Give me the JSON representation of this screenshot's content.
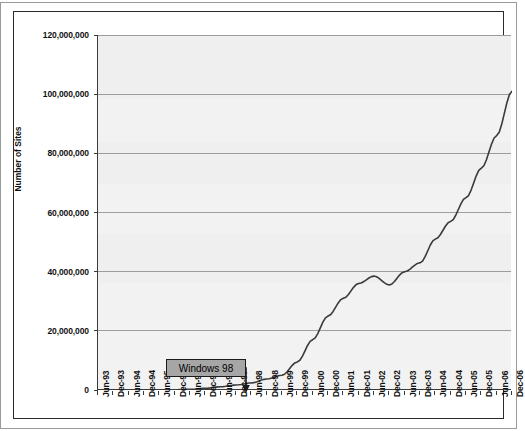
{
  "chart_data": {
    "type": "line",
    "title": "",
    "xlabel": "",
    "ylabel": "Number of Sites",
    "ylim": [
      0,
      120000000
    ],
    "y_ticks": [
      0,
      20000000,
      40000000,
      60000000,
      80000000,
      100000000,
      120000000
    ],
    "y_tick_labels": [
      "0",
      "20,000,000",
      "40,000,000",
      "60,000,000",
      "80,000,000",
      "100,000,000",
      "120,000,000"
    ],
    "grid": true,
    "legend": "none",
    "x_tick_labels": [
      "Jun-93",
      "Dec-93",
      "Jun-94",
      "Dec-94",
      "Jun-95",
      "Dec-95",
      "Jun-96",
      "Dec-96",
      "Jun-97",
      "Dec-97",
      "Jun-98",
      "Dec-98",
      "Jun-99",
      "Dec-99",
      "Jun-00",
      "Dec-00",
      "Jun-01",
      "Dec-01",
      "Jun-02",
      "Dec-02",
      "Jun-03",
      "Dec-03",
      "Jun-04",
      "Dec-04",
      "Jun-05",
      "Dec-05",
      "Jun-06",
      "Dec-06"
    ],
    "series": [
      {
        "name": "Number of Sites",
        "color": "#3a3a3a",
        "x": [
          "Jun-93",
          "Dec-93",
          "Jun-94",
          "Dec-94",
          "Jun-95",
          "Dec-95",
          "Jun-96",
          "Dec-96",
          "Jun-97",
          "Dec-97",
          "Jun-98",
          "Dec-98",
          "Jun-99",
          "Dec-99",
          "Jun-00",
          "Dec-00",
          "Jun-01",
          "Dec-01",
          "Jun-02",
          "Dec-02",
          "Jun-03",
          "Dec-03",
          "Jun-04",
          "Dec-04",
          "Jun-05",
          "Dec-05",
          "Jun-06",
          "Dec-06"
        ],
        "values": [
          130,
          620,
          2700,
          10000,
          23500,
          90000,
          250000,
          600000,
          1100000,
          1700000,
          2400000,
          3700000,
          5000000,
          9500000,
          17000000,
          25000000,
          31000000,
          36000000,
          38500000,
          35500000,
          40000000,
          43000000,
          51000000,
          57000000,
          65000000,
          75000000,
          86000000,
          101000000
        ]
      }
    ],
    "annotations": [
      {
        "label": "Windows 98",
        "points_to_x": "Jun-98",
        "points_to_y": 2400000
      }
    ]
  },
  "axis": {
    "y_title": "Number of Sites"
  }
}
